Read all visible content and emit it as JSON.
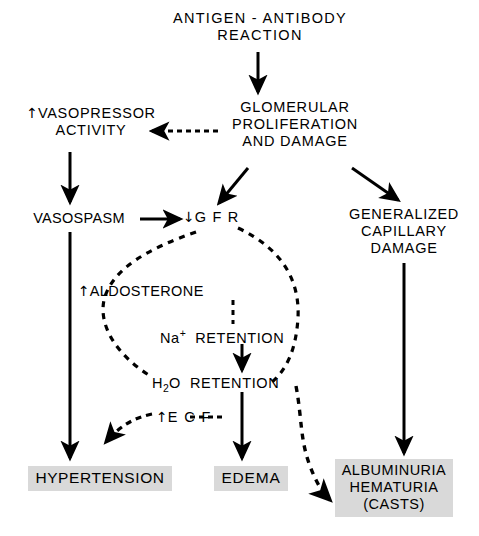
{
  "diagram": {
    "background_color": "#ffffff",
    "line_color": "#000000",
    "box_fill_color": "#d9d9d9",
    "nodes": {
      "antigen": {
        "line1": "ANTIGEN - ANTIBODY",
        "line2": "REACTION"
      },
      "glomerular": {
        "line1": "GLOMERULAR",
        "line2": "PROLIFERATION",
        "line3": "AND  DAMAGE"
      },
      "vasopressor": {
        "arrow": "↑",
        "line1": "VASOPRESSOR",
        "line2": "ACTIVITY"
      },
      "vasospasm": {
        "label": "VASOSPASM"
      },
      "gfr": {
        "arrow": "↓",
        "label": "G F R"
      },
      "capillary": {
        "line1": "GENERALIZED",
        "line2": "CAPILLARY",
        "line3": "DAMAGE"
      },
      "aldosterone": {
        "arrow": "↑",
        "label": "ALDOSTERONE"
      },
      "na_retention": {
        "ion": "Na",
        "charge": "+",
        "label": "RETENTION"
      },
      "h2o_retention": {
        "prefix": "H",
        "sub": "2",
        "prefix2": "O",
        "label": "RETENTION"
      },
      "ecf": {
        "arrow": "↑",
        "label": "E C F"
      },
      "hypertension": {
        "label": "HYPERTENSION"
      },
      "edema": {
        "label": "EDEMA"
      },
      "albuminuria": {
        "line1": "ALBUMINURIA",
        "line2": "HEMATURIA",
        "line3": "(CASTS)"
      }
    },
    "edges": [
      {
        "from": "antigen",
        "to": "glomerular",
        "style": "solid"
      },
      {
        "from": "glomerular",
        "to": "vasopressor",
        "style": "dashed"
      },
      {
        "from": "glomerular",
        "to": "gfr",
        "style": "solid"
      },
      {
        "from": "glomerular",
        "to": "capillary",
        "style": "solid"
      },
      {
        "from": "vasopressor",
        "to": "vasospasm",
        "style": "solid"
      },
      {
        "from": "vasospasm",
        "to": "gfr",
        "style": "solid"
      },
      {
        "from": "vasospasm",
        "to": "hypertension",
        "style": "solid"
      },
      {
        "from": "gfr",
        "to": "aldosterone",
        "style": "dashed"
      },
      {
        "from": "gfr",
        "to": "h2o_retention",
        "style": "dashed"
      },
      {
        "from": "gfr",
        "to": "albuminuria",
        "style": "dashed"
      },
      {
        "from": "aldosterone",
        "to": "na_retention",
        "style": "dashed"
      },
      {
        "from": "na_retention",
        "to": "h2o_retention",
        "style": "solid"
      },
      {
        "from": "h2o_retention",
        "to": "ecf",
        "style": "dashed"
      },
      {
        "from": "h2o_retention",
        "to": "edema",
        "style": "solid"
      },
      {
        "from": "ecf",
        "to": "hypertension",
        "style": "dashed"
      },
      {
        "from": "capillary",
        "to": "albuminuria",
        "style": "solid"
      }
    ]
  }
}
